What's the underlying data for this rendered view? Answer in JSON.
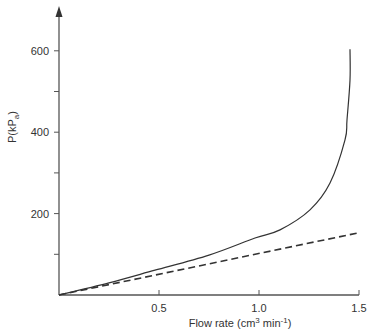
{
  "chart_data": {
    "type": "line",
    "title": "",
    "xlabel": "Flow rate (cm³ min⁻¹)",
    "xlabel_parts": {
      "main": "Flow rate (cm",
      "sup1": "3",
      "mid": " min",
      "sup2": "-1",
      "end": ")"
    },
    "ylabel": "P(kPa)",
    "ylabel_parts": {
      "main": "P(kP",
      "sub": "a",
      "end": ")"
    },
    "xlim": [
      0,
      1.5
    ],
    "ylim": [
      0,
      640
    ],
    "x_ticks": [
      {
        "value": 0.5,
        "label": "0.5"
      },
      {
        "value": 1.0,
        "label": "1.0"
      },
      {
        "value": 1.5,
        "label": "1.5"
      }
    ],
    "y_ticks": [
      {
        "value": 100,
        "label": ""
      },
      {
        "value": 200,
        "label": "200"
      },
      {
        "value": 300,
        "label": ""
      },
      {
        "value": 400,
        "label": "400"
      },
      {
        "value": 500,
        "label": ""
      },
      {
        "value": 600,
        "label": "600"
      }
    ],
    "grid": false,
    "legend": null,
    "series": [
      {
        "name": "measured pressure (solid)",
        "style": "solid",
        "x": [
          0,
          0.25,
          0.48,
          0.75,
          0.98,
          1.105,
          1.255,
          1.355,
          1.43,
          1.44,
          1.455,
          1.455
        ],
        "y": [
          0,
          30,
          61,
          98,
          140,
          160,
          209,
          275,
          381,
          430,
          528,
          604
        ]
      },
      {
        "name": "linear (dashed)",
        "style": "dashed",
        "x": [
          0,
          1.49
        ],
        "y": [
          0,
          152
        ]
      }
    ],
    "colors": {
      "axis": "#555555",
      "line": "#333333"
    }
  }
}
